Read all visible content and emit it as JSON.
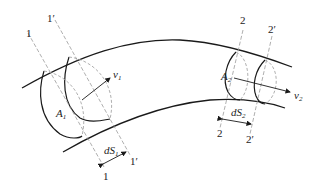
{
  "diagram": {
    "section_labels": {
      "s1_top": "1",
      "s1p_top": "1′",
      "s1_bottom": "1",
      "s1p_bottom": "1′",
      "s2_top": "2",
      "s2p_top": "2′",
      "s2_bottom": "2",
      "s2p_bottom": "2′"
    },
    "quantities": {
      "v1": "v",
      "v1_sub": "1",
      "v2": "v",
      "v2_sub": "2",
      "A1": "A",
      "A1_sub": "1",
      "A2": "A",
      "A2_sub": "2",
      "dS1": "dS",
      "dS1_sub": "1",
      "dS2": "dS",
      "dS2_sub": "2"
    },
    "colors": {
      "solid_line": "#1a1a1a",
      "dashed_line": "#9a9a9a"
    }
  }
}
